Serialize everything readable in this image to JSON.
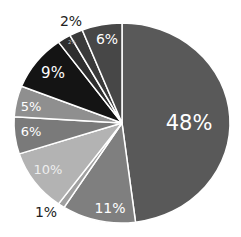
{
  "chart_data": {
    "type": "pie",
    "title": "",
    "start_angle_deg": 0,
    "direction": "clockwise",
    "center": [
      122,
      123
    ],
    "radius": [
      108,
      100
    ],
    "slices": [
      {
        "label": "48%",
        "value": 48,
        "color": "#595959",
        "text_color": "#ffffff",
        "label_pos": [
          189,
          124
        ],
        "font_size": 21,
        "outside": false
      },
      {
        "label": "11%",
        "value": 11,
        "color": "#7f7f7f",
        "text_color": "#ffffff",
        "label_pos": [
          110,
          209
        ],
        "font_size": 14,
        "outside": false
      },
      {
        "label": "1%",
        "value": 1,
        "color": "#a0a0a0",
        "text_color": "#222222",
        "label_pos": [
          46,
          213
        ],
        "font_size": 14,
        "outside": true
      },
      {
        "label": "10%",
        "value": 10,
        "color": "#b3b3b3",
        "text_color": "#eeeeee",
        "label_pos": [
          48,
          170
        ],
        "font_size": 13,
        "outside": false
      },
      {
        "label": "6%",
        "value": 6,
        "color": "#7a7a7a",
        "text_color": "#ffffff",
        "label_pos": [
          31,
          132
        ],
        "font_size": 13,
        "outside": false
      },
      {
        "label": "5%",
        "value": 5,
        "color": "#8f8f8f",
        "text_color": "#ffffff",
        "label_pos": [
          31,
          107
        ],
        "font_size": 13,
        "outside": false
      },
      {
        "label": "9%",
        "value": 9,
        "color": "#141414",
        "text_color": "#ffffff",
        "label_pos": [
          53,
          73
        ],
        "font_size": 15,
        "outside": false
      },
      {
        "label": "2%",
        "value": 2,
        "color": "#2e2e2e",
        "text_color": "#bbbbbb",
        "label_pos": [
          72,
          43
        ],
        "font_size": 5,
        "outside": false
      },
      {
        "label": "2%",
        "value": 2,
        "color": "#3a3a3a",
        "text_color": "#222222",
        "label_pos": [
          71,
          22
        ],
        "font_size": 14,
        "outside": true
      },
      {
        "label": "6%",
        "value": 6,
        "color": "#474747",
        "text_color": "#ffffff",
        "label_pos": [
          107,
          40
        ],
        "font_size": 14,
        "outside": false
      }
    ],
    "legend": "none"
  }
}
